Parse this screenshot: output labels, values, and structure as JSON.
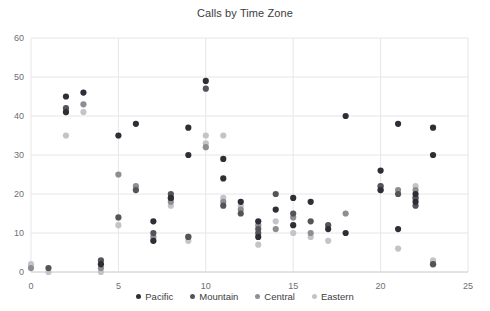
{
  "chart_data": {
    "type": "scatter",
    "title": "Calls by Time Zone",
    "xlabel": "",
    "ylabel": "",
    "xlim": [
      0,
      25
    ],
    "ylim": [
      0,
      60
    ],
    "xticks": [
      0,
      5,
      10,
      15,
      20,
      25
    ],
    "yticks": [
      0,
      10,
      20,
      30,
      40,
      50,
      60
    ],
    "grid": true,
    "legend_position": "bottom",
    "colors": {
      "Pacific": "#2e2e36",
      "Mountain": "#545459",
      "Central": "#8d8d93",
      "Eastern": "#c4c4c8"
    },
    "series": [
      {
        "name": "Pacific",
        "color": "#2e2e36",
        "points": [
          [
            2,
            45
          ],
          [
            2,
            41
          ],
          [
            3,
            46
          ],
          [
            4,
            2
          ],
          [
            5,
            35
          ],
          [
            6,
            38
          ],
          [
            7,
            13
          ],
          [
            7,
            8
          ],
          [
            8,
            19
          ],
          [
            9,
            37
          ],
          [
            9,
            30
          ],
          [
            10,
            49
          ],
          [
            11,
            24
          ],
          [
            11,
            29
          ],
          [
            12,
            18
          ],
          [
            13,
            13
          ],
          [
            13,
            9
          ],
          [
            14,
            16
          ],
          [
            15,
            19
          ],
          [
            15,
            12
          ],
          [
            16,
            18
          ],
          [
            17,
            11
          ],
          [
            18,
            10
          ],
          [
            18,
            40
          ],
          [
            20,
            26
          ],
          [
            20,
            21
          ],
          [
            21,
            38
          ],
          [
            21,
            11
          ],
          [
            22,
            20
          ],
          [
            22,
            18
          ],
          [
            23,
            37
          ],
          [
            23,
            30
          ]
        ]
      },
      {
        "name": "Mountain",
        "color": "#545459",
        "points": [
          [
            1,
            1
          ],
          [
            2,
            42
          ],
          [
            4,
            3
          ],
          [
            5,
            14
          ],
          [
            6,
            21
          ],
          [
            7,
            10
          ],
          [
            8,
            20
          ],
          [
            8,
            19
          ],
          [
            9,
            9
          ],
          [
            10,
            47
          ],
          [
            11,
            17
          ],
          [
            12,
            15
          ],
          [
            13,
            11
          ],
          [
            13,
            10
          ],
          [
            14,
            20
          ],
          [
            15,
            15
          ],
          [
            16,
            13
          ],
          [
            17,
            12
          ],
          [
            20,
            22
          ],
          [
            21,
            20
          ],
          [
            22,
            19
          ],
          [
            22,
            17
          ],
          [
            23,
            2
          ]
        ]
      },
      {
        "name": "Central",
        "color": "#8d8d93",
        "points": [
          [
            0,
            1
          ],
          [
            2,
            41
          ],
          [
            3,
            43
          ],
          [
            4,
            1
          ],
          [
            5,
            25
          ],
          [
            6,
            22
          ],
          [
            7,
            9
          ],
          [
            8,
            18
          ],
          [
            9,
            9
          ],
          [
            10,
            32
          ],
          [
            11,
            18
          ],
          [
            12,
            16
          ],
          [
            13,
            12
          ],
          [
            14,
            11
          ],
          [
            15,
            14
          ],
          [
            16,
            10
          ],
          [
            18,
            15
          ],
          [
            20,
            21
          ],
          [
            21,
            21
          ],
          [
            22,
            21
          ],
          [
            22,
            19
          ],
          [
            23,
            2
          ]
        ]
      },
      {
        "name": "Eastern",
        "color": "#c4c4c8",
        "points": [
          [
            0,
            2
          ],
          [
            1,
            0
          ],
          [
            2,
            35
          ],
          [
            3,
            41
          ],
          [
            4,
            0
          ],
          [
            5,
            12
          ],
          [
            6,
            21
          ],
          [
            7,
            8
          ],
          [
            8,
            17
          ],
          [
            9,
            8
          ],
          [
            10,
            35
          ],
          [
            10,
            33
          ],
          [
            11,
            35
          ],
          [
            11,
            19
          ],
          [
            12,
            17
          ],
          [
            13,
            7
          ],
          [
            14,
            13
          ],
          [
            15,
            10
          ],
          [
            16,
            9
          ],
          [
            17,
            8
          ],
          [
            20,
            22
          ],
          [
            21,
            6
          ],
          [
            22,
            22
          ],
          [
            23,
            3
          ]
        ]
      }
    ],
    "legend": [
      {
        "label": "Pacific",
        "color": "#2e2e36"
      },
      {
        "label": "Mountain",
        "color": "#545459"
      },
      {
        "label": "Central",
        "color": "#8d8d93"
      },
      {
        "label": "Eastern",
        "color": "#c4c4c8"
      }
    ]
  }
}
